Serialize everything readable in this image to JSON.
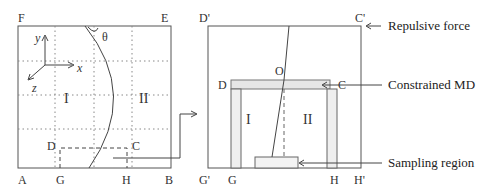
{
  "left_panel": {
    "corners": {
      "F": "F",
      "E": "E",
      "A": "A",
      "B": "B",
      "G": "G",
      "H": "H",
      "D": "D",
      "C": "C"
    },
    "axes": {
      "x": "x",
      "y": "y",
      "z": "z"
    },
    "angle": "θ",
    "regions": {
      "I": "I",
      "II": "II"
    }
  },
  "right_panel": {
    "corners": {
      "Dp": "D'",
      "Cp": "C'",
      "Gp": "G'",
      "Hp": "H'",
      "G": "G",
      "H": "H",
      "D": "D",
      "C": "C",
      "O": "O"
    },
    "regions": {
      "I": "I",
      "II": "II"
    }
  },
  "annotations": {
    "repulsive_force": "Repulsive force",
    "constrained_md": "Constrained MD",
    "sampling_region": "Sampling region"
  },
  "colors": {
    "line": "#444444",
    "grid": "#888888",
    "band": "#e6e6e6"
  }
}
